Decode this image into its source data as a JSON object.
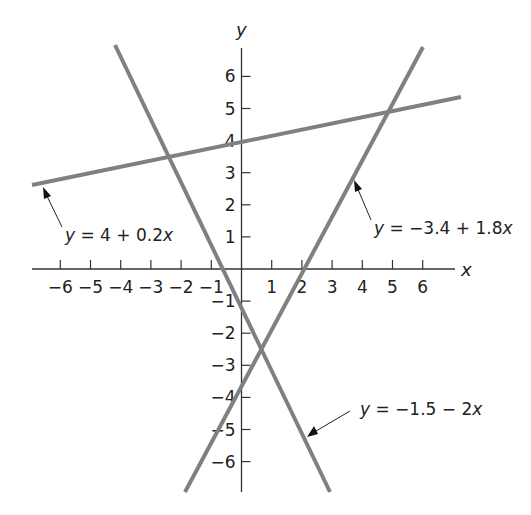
{
  "chart_data": {
    "type": "line",
    "title": "",
    "xlabel": "x",
    "ylabel": "y",
    "xlim": [
      -6.8,
      6.8
    ],
    "ylim": [
      -6.9,
      7.0
    ],
    "grid": false,
    "x_ticks": [
      -6,
      -5,
      -4,
      -3,
      -2,
      -1,
      1,
      2,
      3,
      4,
      5,
      6
    ],
    "y_ticks": [
      6,
      5,
      4,
      3,
      2,
      1,
      -1,
      -2,
      -3,
      -4,
      -5,
      -6
    ],
    "x_tick_labels": [
      "−6",
      "−5",
      "−4",
      "−3",
      "−2",
      "−1",
      "1",
      "2",
      "3",
      "4",
      "5",
      "6"
    ],
    "y_tick_labels": [
      "6",
      "5",
      "4",
      "3",
      "2",
      "1",
      "−1",
      "−2",
      "−3",
      "−4",
      "−5",
      "−6"
    ],
    "series": [
      {
        "name": "y = 4 + 0.2x",
        "intercept": 4,
        "slope": 0.2,
        "x": [
          -6.9,
          7.2
        ],
        "y": [
          2.62,
          5.44
        ],
        "color": "#808080"
      },
      {
        "name": "y = −1.5 − 2x",
        "intercept": -1.5,
        "slope": -2,
        "x": [
          -4.2,
          2.9
        ],
        "y": [
          6.9,
          -7.3
        ],
        "color": "#808080"
      },
      {
        "name": "y = −3.4 + 1.8x",
        "intercept": -3.4,
        "slope": 1.8,
        "x": [
          -1.9,
          6.0
        ],
        "y": [
          -6.8,
          7.4
        ],
        "color": "#808080"
      }
    ],
    "annotations": [
      {
        "text": "y = 4 + 0.2x",
        "arrow_to_x": -6.4,
        "arrow_to_y": 2.7
      },
      {
        "text": "y = −3.4 + 1.8x",
        "arrow_to_x": 3.7,
        "arrow_to_y": 3.2
      },
      {
        "text": "y = −1.5 − 2x",
        "arrow_to_x": 2.3,
        "arrow_to_y": -5.2
      }
    ]
  },
  "labels": {
    "x_axis": "x",
    "y_axis": "y",
    "eq1": {
      "y": "y",
      "rest": " = 4 + 0.2",
      "x": "x"
    },
    "eq2": {
      "y": "y",
      "rest": " = −3.4 + 1.8",
      "x": "x"
    },
    "eq3": {
      "y": "y",
      "rest": " = −1.5 − 2",
      "x": "x"
    }
  },
  "colors": {
    "line": "#808080",
    "axis": "#333333",
    "text": "#222222"
  }
}
